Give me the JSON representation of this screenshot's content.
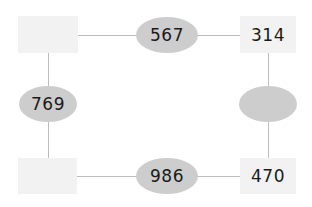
{
  "diagram": {
    "type": "cycle-graph",
    "nodes": {
      "top_left": {
        "shape": "rectangle",
        "label": ""
      },
      "top_right": {
        "shape": "rectangle",
        "label": "314"
      },
      "bottom_left": {
        "shape": "rectangle",
        "label": ""
      },
      "bottom_right": {
        "shape": "rectangle",
        "label": "470"
      }
    },
    "edges": {
      "top": {
        "shape": "oval",
        "label": "567",
        "connects": [
          "top_left",
          "top_right"
        ]
      },
      "left": {
        "shape": "oval",
        "label": "769",
        "connects": [
          "top_left",
          "bottom_left"
        ]
      },
      "bottom": {
        "shape": "oval",
        "label": "986",
        "connects": [
          "bottom_left",
          "bottom_right"
        ]
      },
      "right": {
        "shape": "oval",
        "label": "",
        "connects": [
          "top_right",
          "bottom_right"
        ]
      }
    },
    "colors": {
      "box_fill": "#f2f2f2",
      "oval_fill": "#cdcdcd",
      "line": "#bdbdbd",
      "text": "#1a1a1a"
    }
  }
}
